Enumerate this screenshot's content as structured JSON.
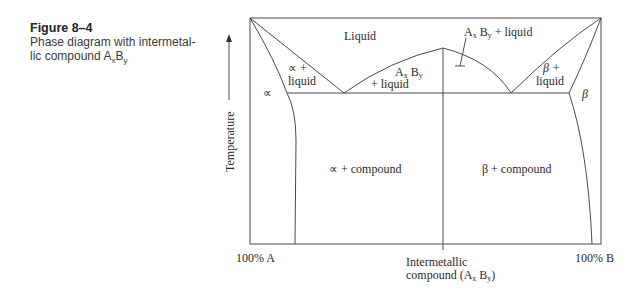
{
  "caption": {
    "figure_number": "Figure 8–4",
    "line1": "Phase diagram with intermetal-",
    "line2_prefix": "lic compound A",
    "line2_sub1": "x",
    "line2_mid": "B",
    "line2_sub2": "y"
  },
  "axes": {
    "y_label": "Temperature",
    "x_left": "100% A",
    "x_right": "100% B",
    "x_mid_line1": "Intermetallic",
    "x_mid_line2": "compound (A",
    "x_mid_sub1": "x",
    "x_mid_b": " B",
    "x_mid_sub2": "y",
    "x_mid_close": ")"
  },
  "regions": {
    "liquid": "Liquid",
    "alpha_liquid_1": "∝ +",
    "alpha_liquid_2": "liquid",
    "alpha": "∝",
    "compound_liquid_left_1": "A",
    "compound_liquid_left_x": "x",
    "compound_liquid_left_b": " B",
    "compound_liquid_left_y": "y",
    "compound_liquid_left_2": "+ liquid",
    "compound_liquid_right_a": "A",
    "compound_liquid_right_x": "x",
    "compound_liquid_right_b": " B",
    "compound_liquid_right_y": "y",
    "compound_liquid_right_rest": " + liquid",
    "beta_liquid_1": "β +",
    "beta_liquid_2": "liquid",
    "beta": "β",
    "alpha_compound": "∝ + compound",
    "beta_compound": "β + compound"
  }
}
